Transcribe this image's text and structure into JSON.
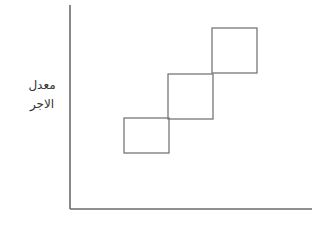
{
  "diagram": {
    "y_axis_label_lines": [
      "معدل",
      "الاجر"
    ],
    "x_axis_label": "",
    "colors": {
      "axis": "#6b6b6b",
      "box": "#777777",
      "label": "#333333"
    },
    "axes": {
      "origin": [
        70,
        209
      ],
      "y_top": 5,
      "x_right": 312
    },
    "boxes": [
      {
        "x": 124,
        "y": 118,
        "w": 45,
        "h": 35
      },
      {
        "x": 168,
        "y": 74,
        "w": 45,
        "h": 45
      },
      {
        "x": 212,
        "y": 28,
        "w": 45,
        "h": 45
      }
    ]
  }
}
